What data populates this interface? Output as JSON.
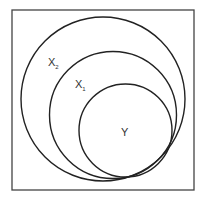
{
  "diagram": {
    "type": "nested-sets",
    "frame": {
      "x": 12,
      "y": 10,
      "width": 182,
      "height": 180
    },
    "sets": [
      {
        "id": "X2",
        "label": "X",
        "subscript": "2",
        "cx": 103,
        "cy": 99,
        "r": 82,
        "label_x": 48,
        "label_y": 65
      },
      {
        "id": "X1",
        "label": "X",
        "subscript": "1",
        "cx": 113,
        "cy": 115,
        "r": 65,
        "label_x": 75,
        "label_y": 87
      },
      {
        "id": "Y",
        "label": "Y",
        "subscript": "",
        "cx": 125.5,
        "cy": 130.5,
        "r": 46.5,
        "label_x": 121,
        "label_y": 136
      }
    ],
    "stroke_color": "#222222"
  }
}
